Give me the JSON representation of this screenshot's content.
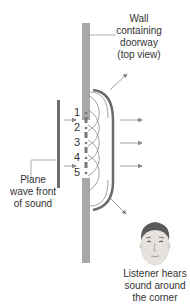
{
  "labels": {
    "wall": [
      "Wall",
      "containing",
      "doorway",
      "(top view)"
    ],
    "wavefront": [
      "Plane",
      "wave front",
      "of sound"
    ],
    "listener": [
      "Listener hears",
      "sound around",
      "the corner"
    ]
  },
  "source_points": [
    "1",
    "2",
    "3",
    "4",
    "5"
  ],
  "colors": {
    "wall": "#a8a8a8",
    "wavefront": "#6e6e6e",
    "arc": "#6a6a6a",
    "wavelets": "#8c8c8c",
    "arrows": "#8a8a8a",
    "text": "#333333"
  }
}
